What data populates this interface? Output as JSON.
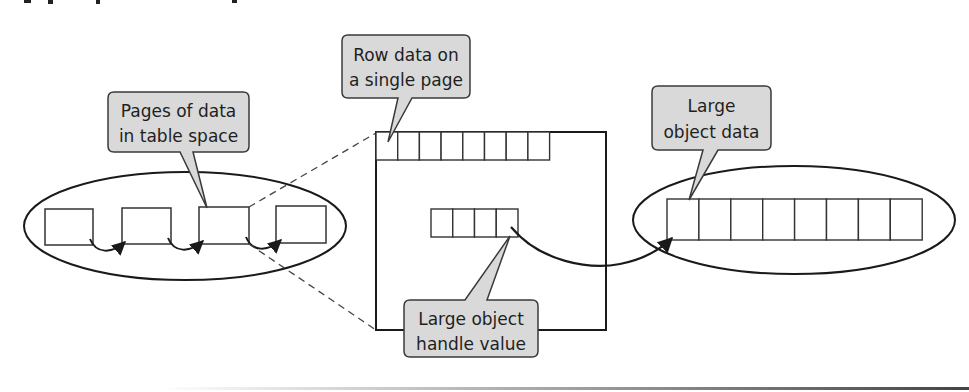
{
  "figure": {
    "clipped_title_text": "Figure caption (cropped, illegible)",
    "colors": {
      "stroke": "#1a1a1a",
      "callout_fill": "#d9d9d9",
      "callout_stroke": "#3a3a3a",
      "dashed": "#444444",
      "background": "#ffffff"
    }
  },
  "callouts": {
    "table_space": {
      "line1": "Pages of data",
      "line2": "in table space"
    },
    "row_data": {
      "line1": "Row data on",
      "line2": "a single page"
    },
    "lob_data": {
      "line1": "Large",
      "line2": "object data"
    },
    "lob_handle": {
      "line1": "Large object",
      "line2": "handle value"
    }
  },
  "table_space": {
    "page_count": 4
  },
  "single_page": {
    "row_cell_count": 8,
    "handle_cell_count": 4
  },
  "lob_space": {
    "cell_count": 8
  }
}
